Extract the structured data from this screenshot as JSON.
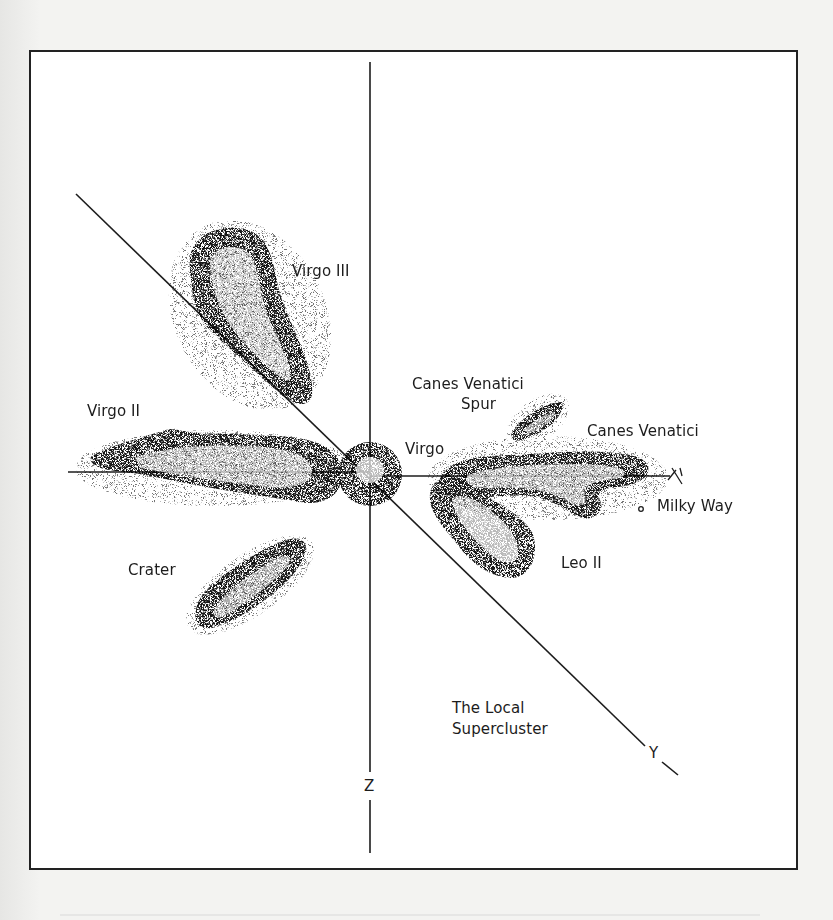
{
  "figure": {
    "colors": {
      "background": "#f3f3f1",
      "panel": "#ffffff",
      "ink": "#1c1c1c"
    }
  },
  "axes": {
    "x_label": "X",
    "y_label": "Y",
    "z_label": "Z"
  },
  "labels": {
    "virgo_iii": "Virgo III",
    "virgo_ii": "Virgo II",
    "virgo": "Virgo",
    "canes_venatici_spur_line1": "Canes Venatici",
    "canes_venatici_spur_line2": "Spur",
    "canes_venatici": "Canes Venatici",
    "milky_way": "Milky Way",
    "leo_ii": "Leo II",
    "crater": "Crater",
    "supercluster_line1": "The Local",
    "supercluster_line2": "Supercluster"
  },
  "structures": [
    {
      "name": "Virgo",
      "type": "cluster core",
      "center": [
        370,
        473
      ]
    },
    {
      "name": "Virgo II",
      "type": "cloud",
      "extent": [
        [
          88,
          430
        ],
        [
          345,
          505
        ]
      ]
    },
    {
      "name": "Virgo III",
      "type": "cloud",
      "extent": [
        [
          185,
          225
        ],
        [
          315,
          405
        ]
      ]
    },
    {
      "name": "Canes Venatici Spur",
      "type": "cloud",
      "extent": [
        [
          510,
          400
        ],
        [
          565,
          440
        ]
      ]
    },
    {
      "name": "Canes Venatici",
      "type": "cloud",
      "extent": [
        [
          440,
          450
        ],
        [
          650,
          525
        ]
      ]
    },
    {
      "name": "Leo II",
      "type": "cloud",
      "extent": [
        [
          425,
          470
        ],
        [
          540,
          580
        ]
      ]
    },
    {
      "name": "Crater",
      "type": "cloud",
      "extent": [
        [
          190,
          535
        ],
        [
          310,
          630
        ]
      ]
    },
    {
      "name": "Milky Way",
      "type": "point",
      "center": [
        641,
        509
      ]
    }
  ]
}
